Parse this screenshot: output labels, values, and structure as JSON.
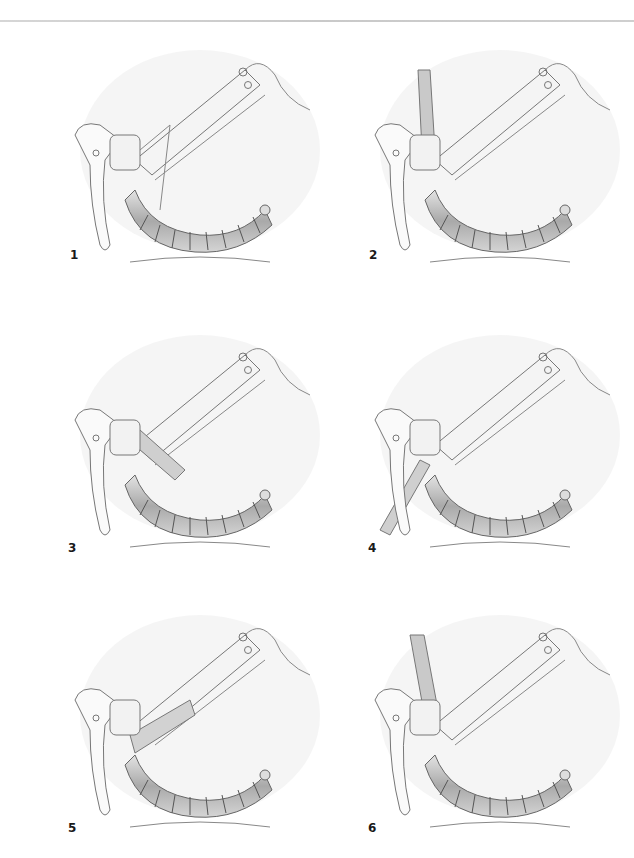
{
  "document": {
    "type": "instructional illustration sheet",
    "subject": "handlebar tape wrapping steps"
  },
  "steps": [
    {
      "number": "1",
      "illustration": "bar-tape-step-1"
    },
    {
      "number": "2",
      "illustration": "bar-tape-step-2"
    },
    {
      "number": "3",
      "illustration": "bar-tape-step-3"
    },
    {
      "number": "4",
      "illustration": "bar-tape-step-4"
    },
    {
      "number": "5",
      "illustration": "bar-tape-step-5"
    },
    {
      "number": "6",
      "illustration": "bar-tape-step-6"
    }
  ],
  "colors": {
    "background": "#ffffff",
    "rule": "#cccccc",
    "linework": "#6b6b6b",
    "shading": "#bdbdbd",
    "label": "#1a1a1a"
  }
}
